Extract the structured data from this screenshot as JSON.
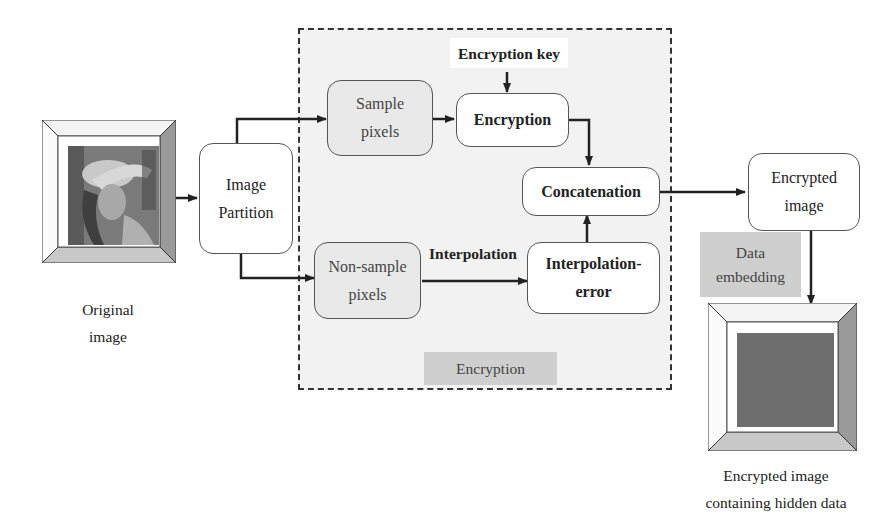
{
  "diagram": {
    "region_label": "Encryption",
    "input": {
      "caption_line1": "Original",
      "caption_line2": "image",
      "picture": "lena-photo"
    },
    "nodes": {
      "image_partition": {
        "line1": "Image",
        "line2": "Partition"
      },
      "sample_pixels": {
        "line1": "Sample",
        "line2": "pixels"
      },
      "encryption": {
        "label": "Encryption"
      },
      "encryption_key": {
        "label": "Encryption key"
      },
      "concatenation": {
        "label": "Concatenation"
      },
      "non_sample_pixels": {
        "line1": "Non-sample",
        "line2": "pixels"
      },
      "interpolation_edge": {
        "label": "Interpolation"
      },
      "interpolation_error": {
        "line1": "Interpolation-",
        "line2": "error"
      },
      "encrypted_image": {
        "line1": "Encrypted",
        "line2": "image"
      },
      "data_embedding": {
        "line1": "Data",
        "line2": "embedding"
      }
    },
    "output": {
      "caption_line1": "Encrypted image",
      "caption_line2": "containing hidden data",
      "picture": "noise-image"
    },
    "edges": [
      {
        "from": "original_image",
        "to": "image_partition"
      },
      {
        "from": "image_partition",
        "to": "sample_pixels"
      },
      {
        "from": "image_partition",
        "to": "non_sample_pixels"
      },
      {
        "from": "sample_pixels",
        "to": "encryption"
      },
      {
        "from": "encryption_key",
        "to": "encryption"
      },
      {
        "from": "encryption",
        "to": "concatenation"
      },
      {
        "from": "non_sample_pixels",
        "to": "interpolation_error",
        "label": "Interpolation"
      },
      {
        "from": "interpolation_error",
        "to": "concatenation"
      },
      {
        "from": "concatenation",
        "to": "encrypted_image"
      },
      {
        "from": "encrypted_image",
        "to": "output_image",
        "label": "Data embedding"
      }
    ],
    "colors": {
      "region_fill": "#f2f2f2",
      "tag_fill": "#cfcfcf",
      "box_stroke": "#555555",
      "line": "#222222"
    }
  }
}
